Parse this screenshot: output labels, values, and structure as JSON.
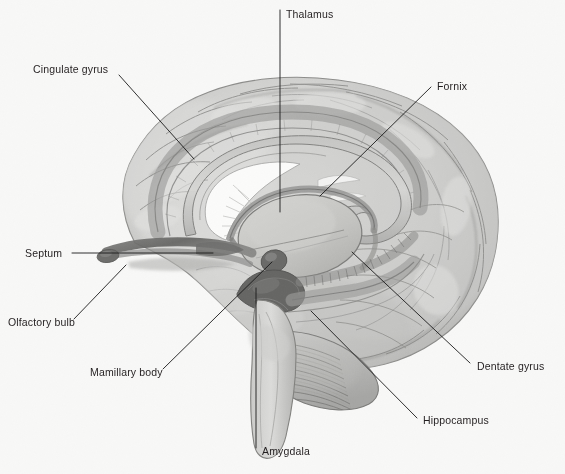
{
  "figure": {
    "width": 565,
    "height": 474,
    "background_color": "#f8f8f7",
    "illustration_style": "grayscale pencil and wash anatomical drawing",
    "text_color": "#231f20",
    "leader_line_color": "#1a1a1a"
  },
  "labels": [
    {
      "id": "thalamus",
      "text": "Thalamus",
      "text_x": 286,
      "text_y": 18,
      "anchor": "start",
      "leader": "M 280 10 L 280 212",
      "leader_kind": "vertical"
    },
    {
      "id": "cingulate-gyrus",
      "text": "Cingulate gyrus",
      "text_x": 33,
      "text_y": 73,
      "anchor": "start",
      "leader": "M 119 75 L 194 159",
      "leader_kind": "diagonal"
    },
    {
      "id": "fornix",
      "text": "Fornix",
      "text_x": 437,
      "text_y": 90,
      "anchor": "start",
      "leader": "M 431 87 L 320 196",
      "leader_kind": "diagonal"
    },
    {
      "id": "septum",
      "text": "Septum",
      "text_x": 25,
      "text_y": 257,
      "anchor": "start",
      "leader": "M 72 253 L 213 253",
      "leader_kind": "horizontal"
    },
    {
      "id": "olfactory-bulb",
      "text": "Olfactory bulb",
      "text_x": 8,
      "text_y": 326,
      "anchor": "start",
      "leader": "M 74 319 L 126 265",
      "leader_kind": "diagonal"
    },
    {
      "id": "mamillary-body",
      "text": "Mamillary body",
      "text_x": 90,
      "text_y": 376,
      "anchor": "start",
      "leader": "M 163 369 L 272 262",
      "leader_kind": "diagonal"
    },
    {
      "id": "amygdala",
      "text": "Amygdala",
      "text_x": 262,
      "text_y": 455,
      "anchor": "start",
      "leader": "M 256 448 L 256 288",
      "leader_kind": "vertical"
    },
    {
      "id": "hippocampus",
      "text": "Hippocampus",
      "text_x": 423,
      "text_y": 424,
      "anchor": "start",
      "leader": "M 417 418 L 311 311",
      "leader_kind": "diagonal"
    },
    {
      "id": "dentate-gyrus",
      "text": "Dentate gyrus",
      "text_x": 477,
      "text_y": 370,
      "anchor": "start",
      "leader": "M 470 363 L 352 252",
      "leader_kind": "diagonal"
    }
  ],
  "anatomy": {
    "cerebrum_label": "cerebral cortex with gyri and sulci",
    "cerebellum_label": "cerebellum with foliated texture",
    "brainstem_label": "brainstem",
    "corpus_callosum_label": "corpus callosum",
    "ventricle_label": "lateral ventricle",
    "tones": {
      "cortex_light": "#d8d8d6",
      "cortex_mid": "#c3c3c1",
      "cortex_dark": "#a9a9a7",
      "sulcus_line": "#8a8a88",
      "limbic_band": "#9a9a98",
      "dark_structure": "#6b6b69",
      "ventricle_white": "#fbfbfa",
      "thalamus_fill": "#c9c9c6"
    }
  }
}
